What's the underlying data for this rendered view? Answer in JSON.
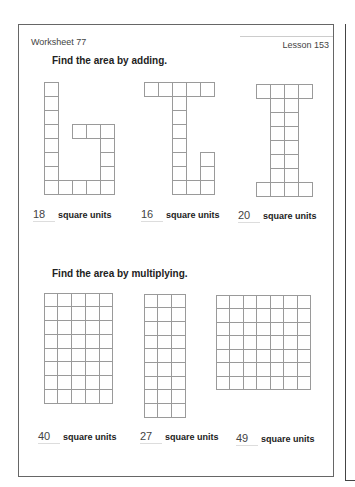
{
  "header": {
    "worksheet": "Worksheet 77",
    "lesson": "Lesson 153"
  },
  "section1": {
    "heading": "Find the area by adding.",
    "problems": [
      {
        "answer": "18",
        "unit": "square units",
        "shape_rows": [
          "10000",
          "10000",
          "10000",
          "10111",
          "10001",
          "10001",
          "10001",
          "11111"
        ]
      },
      {
        "answer": "16",
        "unit": "square units",
        "shape_rows": [
          "11111",
          "00100",
          "00100",
          "00100",
          "00100",
          "00101",
          "00101",
          "00111"
        ]
      },
      {
        "answer": "20",
        "unit": "square units",
        "shape_rows": [
          "1111",
          "0110",
          "0110",
          "0110",
          "0110",
          "0110",
          "0110",
          "1111"
        ]
      }
    ]
  },
  "section2": {
    "heading": "Find the area by multiplying.",
    "problems": [
      {
        "answer": "40",
        "unit": "square units",
        "cols": 5,
        "rows": 8
      },
      {
        "answer": "27",
        "unit": "square units",
        "cols": 3,
        "rows": 9
      },
      {
        "answer": "49",
        "unit": "square units",
        "cols": 7,
        "rows": 7
      }
    ]
  }
}
